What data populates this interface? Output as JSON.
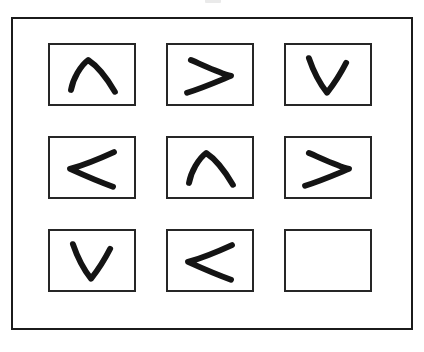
{
  "page": {
    "background_color": "#ffffff",
    "width": 424,
    "height": 352
  },
  "artifact": {
    "name": "clipped-mark-top-edge",
    "description": "faint partially cropped gray mark at the top edge of the scan",
    "color": "#d8d8d8"
  },
  "frame": {
    "label": "puzzle-outer-frame",
    "border_color": "#1b1b1b",
    "border_width": 2,
    "fill": "#ffffff"
  },
  "matrix": {
    "rows": 3,
    "columns": 3,
    "cell_border_color": "#262626",
    "cell_fill": "#ffffff",
    "stroke_color": "#141414",
    "stroke_width": 6,
    "cells": [
      {
        "index": 1,
        "row": 1,
        "column": 1,
        "symbol": "up-chevron",
        "glyph": "∧",
        "empty": false,
        "path": "M 22 48 C 24 36 32 22 40 16 C 49 22 60 36 68 50"
      },
      {
        "index": 2,
        "row": 1,
        "column": 2,
        "symbol": "right-chevron",
        "glyph": ">",
        "empty": false,
        "path": "M 24 16 C 38 22 54 30 66 33 C 54 38 36 46 20 51"
      },
      {
        "index": 3,
        "row": 1,
        "column": 3,
        "symbol": "down-chevron",
        "glyph": "∨",
        "empty": false,
        "path": "M 24 14 C 28 26 36 42 43 51 C 50 42 58 29 63 19"
      },
      {
        "index": 4,
        "row": 2,
        "column": 1,
        "symbol": "left-chevron",
        "glyph": "<",
        "empty": false,
        "path": "M 67 15 C 52 22 35 29 21 33 C 34 39 52 47 66 52"
      },
      {
        "index": 5,
        "row": 2,
        "column": 2,
        "symbol": "up-chevron",
        "glyph": "∧",
        "empty": false,
        "path": "M 22 48 C 24 36 32 22 40 16 C 49 22 60 36 68 50"
      },
      {
        "index": 6,
        "row": 2,
        "column": 3,
        "symbol": "right-chevron",
        "glyph": ">",
        "empty": false,
        "path": "M 24 16 C 38 22 54 30 66 33 C 54 38 36 46 20 51"
      },
      {
        "index": 7,
        "row": 3,
        "column": 1,
        "symbol": "down-chevron",
        "glyph": "∨",
        "empty": false,
        "path": "M 24 14 C 28 26 36 42 43 51 C 50 42 58 29 63 19"
      },
      {
        "index": 8,
        "row": 3,
        "column": 2,
        "symbol": "left-chevron",
        "glyph": "<",
        "empty": false,
        "path": "M 67 15 C 52 22 35 29 21 33 C 34 39 52 47 66 52"
      },
      {
        "index": 9,
        "row": 3,
        "column": 3,
        "symbol": "blank",
        "glyph": "",
        "empty": true,
        "path": ""
      }
    ]
  }
}
